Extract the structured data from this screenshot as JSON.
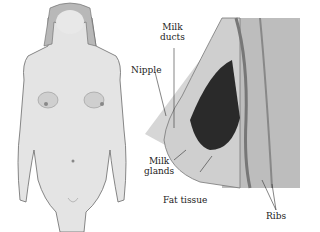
{
  "figure": {
    "labels": {
      "milk_ducts": "Milk\nducts",
      "milk_ducts_line1": "Milk",
      "milk_ducts_line2": "ducts",
      "nipple": "Nipple",
      "milk_glands_line1": "Milk",
      "milk_glands_line2": "glands",
      "fat_tissue": "Fat tissue",
      "ribs": "Ribs"
    }
  },
  "colors": {
    "skin": "#d9d9d9",
    "shadow": "#9a9a9a",
    "cone": "#d6d6d6",
    "gland": "#2a2a2a",
    "background": "#ffffff"
  }
}
